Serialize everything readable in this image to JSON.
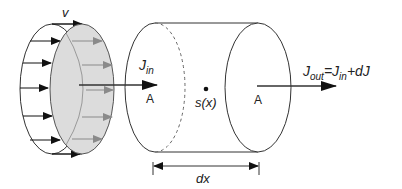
{
  "diagram": {
    "velocity_label": "v",
    "flux_in": {
      "main": "J",
      "sub": "in"
    },
    "area_left": "A",
    "area_right": "A",
    "source": "s(x)",
    "flux_out": {
      "main": "J",
      "sub": "out",
      "equals": "=",
      "rhs_main": "J",
      "rhs_sub": "in",
      "plus": "+",
      "dJ": "dJ"
    },
    "length_label": "dx",
    "colors": {
      "stroke": "#333333",
      "shade": "#dcdcdc",
      "grey_arrow": "#8a8a8a"
    }
  }
}
